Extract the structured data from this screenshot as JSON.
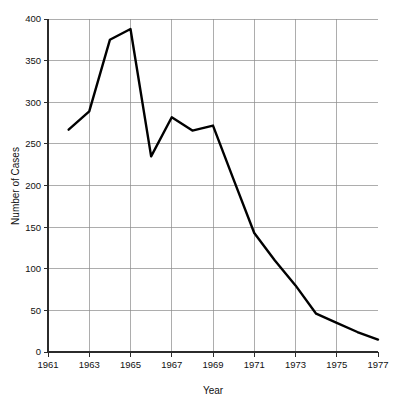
{
  "chart_data": {
    "type": "line",
    "title": "",
    "xlabel": "Year",
    "ylabel": "Number of Cases",
    "xlim": [
      1961,
      1977
    ],
    "ylim": [
      0,
      400
    ],
    "grid": true,
    "legend": "none",
    "x_ticks": [
      "1961",
      "1963",
      "1965",
      "1967",
      "1969",
      "1971",
      "1973",
      "1975",
      "1977"
    ],
    "y_ticks": [
      "0",
      "50",
      "100",
      "150",
      "200",
      "250",
      "300",
      "350",
      "400"
    ],
    "x": [
      1962,
      1963,
      1964,
      1965,
      1966,
      1967,
      1968,
      1969,
      1970,
      1971,
      1972,
      1973,
      1974,
      1975,
      1976,
      1977
    ],
    "values": [
      267,
      289,
      375,
      388,
      235,
      282,
      266,
      272,
      207,
      143,
      110,
      80,
      46,
      35,
      24,
      15
    ],
    "series": [
      {
        "name": "Number of Cases",
        "values": [
          267,
          289,
          375,
          388,
          235,
          282,
          266,
          272,
          207,
          143,
          110,
          80,
          46,
          35,
          24,
          15
        ]
      }
    ]
  }
}
